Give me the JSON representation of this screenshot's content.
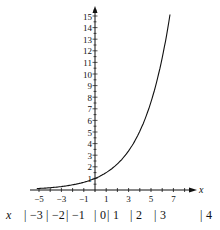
{
  "chart_data": {
    "type": "line",
    "title": "",
    "xlabel": "x",
    "ylabel": "",
    "function": "y = (3/2)^x",
    "xlim": [
      -5.5,
      8
    ],
    "ylim": [
      0,
      15.5
    ],
    "x_tick_labels": [
      "-5",
      "-3",
      "-1",
      "1",
      "3",
      "5",
      "7"
    ],
    "y_tick_labels": [
      "1",
      "2",
      "3",
      "4",
      "5",
      "6",
      "7",
      "8",
      "9",
      "10",
      "11",
      "12",
      "13",
      "14",
      "15"
    ],
    "series": [
      {
        "name": "curve",
        "x": [
          -5,
          -4,
          -3,
          -2,
          -1,
          0,
          1,
          2,
          3,
          4,
          5,
          6,
          6.7
        ],
        "y": [
          0.13,
          0.2,
          0.3,
          0.44,
          0.67,
          1,
          1.5,
          2.25,
          3.38,
          5.06,
          7.59,
          11.39,
          15.0
        ]
      }
    ],
    "grid": false,
    "legend": null
  },
  "table": {
    "header": "x",
    "cells": [
      "−3",
      "−2",
      "−1",
      "0",
      "1",
      "2",
      "3",
      "4"
    ]
  }
}
